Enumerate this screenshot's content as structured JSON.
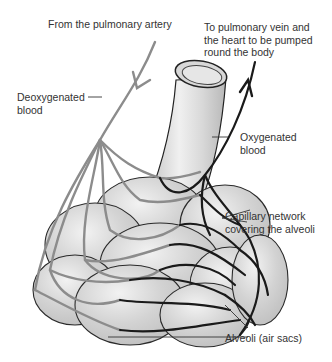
{
  "diagram": {
    "labels": {
      "pulmonary_artery": "From the pulmonary artery",
      "pulmonary_vein_line1": "To pulmonary vein and",
      "pulmonary_vein_line2": "the heart to be pumped",
      "pulmonary_vein_line3": "round the body",
      "deoxygenated_line1": "Deoxygenated",
      "deoxygenated_line2": "blood",
      "oxygenated_line1": "Oxygenated",
      "oxygenated_line2": "blood",
      "capillary_line1": "Capillary network",
      "capillary_line2": "covering the alveoli",
      "alveoli": "Alveoli (air sacs)"
    },
    "colors": {
      "deoxygenated_vessel": "#8c8c8c",
      "oxygenated_vessel": "#1a1a1a",
      "alveoli_fill": "#d0d0d0",
      "alveoli_outline": "#2a2a2a",
      "text": "#333333",
      "background": "#ffffff"
    }
  }
}
